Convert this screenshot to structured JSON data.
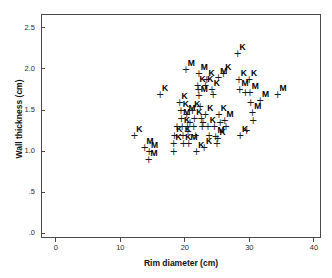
{
  "chart_data": {
    "type": "scatter",
    "title": "",
    "xlabel": "Rim diameter (cm)",
    "ylabel": "Wall thickness (cm)",
    "xlim": [
      -2.3,
      41.1
    ],
    "ylim": [
      -0.06,
      2.67
    ],
    "xticks": [
      0,
      10,
      20,
      30,
      40
    ],
    "xticklabels": [
      "0",
      "10",
      "20",
      "30",
      "40"
    ],
    "yticks": [
      0,
      0.5,
      1.0,
      1.5,
      2.0,
      2.5
    ],
    "yticklabels": [
      ".0",
      ".5",
      "1.0",
      "1.5",
      "2.0",
      "2.5"
    ],
    "grid": false,
    "legend": "none",
    "marker": "+",
    "point_label_field": "site code",
    "point_labels": [
      "K",
      "M"
    ],
    "series": [
      {
        "name": "pottery vessels",
        "marker_color": "#1a1a1a",
        "points": [
          {
            "x": 12.0,
            "y": 1.2,
            "label": "K"
          },
          {
            "x": 13.6,
            "y": 1.05,
            "label": "M"
          },
          {
            "x": 14.3,
            "y": 1.0,
            "label": "M"
          },
          {
            "x": 14.2,
            "y": 0.9,
            "label": "M"
          },
          {
            "x": 16.0,
            "y": 1.7,
            "label": "K"
          },
          {
            "x": 18.2,
            "y": 1.2,
            "label": "K"
          },
          {
            "x": 18.1,
            "y": 1.1,
            "label": "K"
          },
          {
            "x": 18.1,
            "y": 1.0,
            "label": ""
          },
          {
            "x": 18.6,
            "y": 1.3,
            "label": ""
          },
          {
            "x": 19.0,
            "y": 1.6,
            "label": "K"
          },
          {
            "x": 19.2,
            "y": 1.5,
            "label": "K"
          },
          {
            "x": 19.3,
            "y": 1.4,
            "label": "M"
          },
          {
            "x": 19.4,
            "y": 1.3,
            "label": "K"
          },
          {
            "x": 19.5,
            "y": 1.2,
            "label": "K"
          },
          {
            "x": 19.6,
            "y": 1.1,
            "label": "K"
          },
          {
            "x": 20.0,
            "y": 2.0,
            "label": "M"
          },
          {
            "x": 20.1,
            "y": 1.45,
            "label": "M"
          },
          {
            "x": 20.2,
            "y": 1.3,
            "label": ""
          },
          {
            "x": 20.3,
            "y": 1.25,
            "label": ""
          },
          {
            "x": 20.4,
            "y": 1.1,
            "label": "M"
          },
          {
            "x": 20.6,
            "y": 1.35,
            "label": ""
          },
          {
            "x": 21.0,
            "y": 1.5,
            "label": "K"
          },
          {
            "x": 21.2,
            "y": 1.3,
            "label": ""
          },
          {
            "x": 21.3,
            "y": 1.4,
            "label": "K"
          },
          {
            "x": 21.5,
            "y": 1.2,
            "label": ""
          },
          {
            "x": 21.6,
            "y": 1.0,
            "label": "K"
          },
          {
            "x": 21.8,
            "y": 1.8,
            "label": "K"
          },
          {
            "x": 21.9,
            "y": 1.75,
            "label": ""
          },
          {
            "x": 22.0,
            "y": 1.68,
            "label": "M"
          },
          {
            "x": 22.0,
            "y": 1.95,
            "label": "M"
          },
          {
            "x": 22.2,
            "y": 1.55,
            "label": ""
          },
          {
            "x": 22.4,
            "y": 1.4,
            "label": ""
          },
          {
            "x": 22.5,
            "y": 1.3,
            "label": ""
          },
          {
            "x": 22.6,
            "y": 1.35,
            "label": ""
          },
          {
            "x": 22.8,
            "y": 1.05,
            "label": "K"
          },
          {
            "x": 23.0,
            "y": 1.8,
            "label": "K"
          },
          {
            "x": 23.0,
            "y": 1.45,
            "label": "K"
          },
          {
            "x": 23.2,
            "y": 1.88,
            "label": "K"
          },
          {
            "x": 23.4,
            "y": 1.3,
            "label": "K"
          },
          {
            "x": 23.6,
            "y": 1.2,
            "label": ""
          },
          {
            "x": 24.0,
            "y": 1.75,
            "label": "K"
          },
          {
            "x": 24.2,
            "y": 1.7,
            "label": ""
          },
          {
            "x": 24.4,
            "y": 1.3,
            "label": ""
          },
          {
            "x": 24.6,
            "y": 1.18,
            "label": "M"
          },
          {
            "x": 24.9,
            "y": 1.16,
            "label": "K"
          },
          {
            "x": 24.8,
            "y": 1.1,
            "label": ""
          },
          {
            "x": 25.0,
            "y": 1.9,
            "label": "M"
          },
          {
            "x": 25.1,
            "y": 1.45,
            "label": "K"
          },
          {
            "x": 25.3,
            "y": 1.35,
            "label": ""
          },
          {
            "x": 25.8,
            "y": 1.95,
            "label": "K"
          },
          {
            "x": 26.0,
            "y": 1.38,
            "label": "M"
          },
          {
            "x": 26.2,
            "y": 1.3,
            "label": ""
          },
          {
            "x": 28.0,
            "y": 2.2,
            "label": "K"
          },
          {
            "x": 28.2,
            "y": 1.88,
            "label": "K"
          },
          {
            "x": 28.3,
            "y": 1.75,
            "label": "M"
          },
          {
            "x": 28.4,
            "y": 1.2,
            "label": "K"
          },
          {
            "x": 29.2,
            "y": 1.72,
            "label": ""
          },
          {
            "x": 29.4,
            "y": 1.26,
            "label": ""
          },
          {
            "x": 29.8,
            "y": 1.88,
            "label": "K"
          },
          {
            "x": 29.9,
            "y": 1.72,
            "label": "M"
          },
          {
            "x": 30.0,
            "y": 1.6,
            "label": ""
          },
          {
            "x": 30.3,
            "y": 1.48,
            "label": "M"
          },
          {
            "x": 30.4,
            "y": 1.38,
            "label": ""
          },
          {
            "x": 31.5,
            "y": 1.62,
            "label": "M"
          },
          {
            "x": 34.2,
            "y": 1.7,
            "label": "M"
          }
        ]
      }
    ]
  }
}
